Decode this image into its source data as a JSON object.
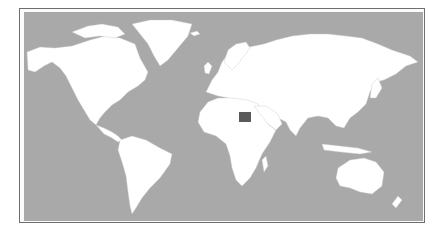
{
  "map": {
    "type": "world-locator-map",
    "highlighted_country": "Egypt",
    "colors": {
      "ocean": "#a9a9a9",
      "land": "#ffffff",
      "borders": "#c8c8c8",
      "highlight": "#5a5a5a",
      "frame": "#6e6e6e"
    }
  }
}
